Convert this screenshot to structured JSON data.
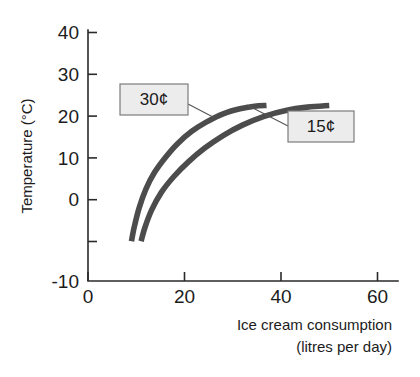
{
  "chart_data": {
    "type": "line",
    "title": "",
    "xlabel": "Ice cream consumption",
    "xlabel_line2": "(litres per day)",
    "ylabel": "Temperature (°C)",
    "xlim": [
      0,
      68
    ],
    "ylim": [
      -10,
      40
    ],
    "xticks": [
      0,
      20,
      40,
      60
    ],
    "xtick_labels": [
      "0",
      "20",
      "40",
      "60"
    ],
    "yticks": [
      -10,
      0,
      10,
      20,
      30,
      40
    ],
    "ytick_labels": [
      "-10",
      "0",
      "10",
      "20",
      "30",
      "40"
    ],
    "grid": false,
    "legend_position": "inline-callouts",
    "series": [
      {
        "name": "30¢",
        "label": "30¢",
        "color": "#4c4c4c",
        "x": [
          9.0,
          9.6,
          10.6,
          12.0,
          13.8,
          16.0,
          18.5,
          21.5,
          24.5,
          28.0,
          31.5,
          34.5,
          37.0
        ],
        "y": [
          -0.5,
          3.0,
          7.5,
          12.0,
          16.0,
          19.5,
          22.8,
          25.8,
          28.0,
          30.0,
          31.2,
          31.8,
          32.0
        ]
      },
      {
        "name": "15¢",
        "label": "15¢",
        "color": "#4c4c4c",
        "x": [
          11.0,
          11.8,
          13.2,
          15.2,
          17.8,
          20.8,
          24.2,
          28.0,
          32.0,
          36.5,
          41.0,
          45.5,
          50.0
        ],
        "y": [
          -0.5,
          2.8,
          7.0,
          11.2,
          15.0,
          18.5,
          21.8,
          24.8,
          27.3,
          29.4,
          30.8,
          31.6,
          32.0
        ]
      }
    ],
    "annotations": [
      {
        "name": "30c-callout",
        "text": "30¢",
        "points_to_series": "30¢",
        "anchor_x": 21.0,
        "anchor_y": 25.5
      },
      {
        "name": "15c-callout",
        "text": "15¢",
        "points_to_series": "15¢",
        "anchor_x": 31.5,
        "anchor_y": 28.5
      }
    ],
    "colors": {
      "curve": "#4c4c4c",
      "axis": "#2a2a2a",
      "callout_fill": "#ececec",
      "callout_border": "#7c7c7c",
      "background": "#ffffff"
    }
  }
}
